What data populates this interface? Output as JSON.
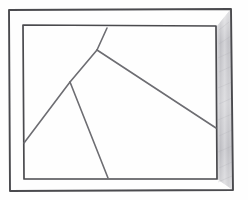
{
  "document": {
    "title": "Hand-drawn framed geometric partition sketch",
    "medium": "pencil-on-paper line drawing",
    "width": 248,
    "height": 200
  },
  "colors": {
    "paper": "#fefefe",
    "ink": "#4a4a4e",
    "ink_light": "#6d6d72",
    "shading": "#b9b9bd",
    "shading_light": "#d8d8db"
  },
  "strokes": {
    "outer_frame_width": 1.9,
    "inner_frame_width": 1.7,
    "partition_width": 1.6
  },
  "shapes": {
    "outer_frame": {
      "name": "outer-frame",
      "points": "9,10 231,9 233,190 10,191"
    },
    "inner_frame": {
      "name": "inner-frame",
      "points": "23,25 216,26 217,179 24,179"
    },
    "shaded_band": {
      "name": "right-border-shading",
      "points": "217,26 231,9 233,190 217,179"
    }
  },
  "partitions": [
    {
      "name": "partition-line-upper-left",
      "from_label": "top-edge",
      "to_label": "center-junction",
      "x1": 107,
      "y1": 28,
      "x2": 97,
      "y2": 50
    },
    {
      "name": "partition-line-long-diagonal",
      "from_label": "center-junction",
      "to_label": "right-edge",
      "x1": 97,
      "y1": 50,
      "x2": 216,
      "y2": 128
    },
    {
      "name": "partition-line-middle-left",
      "from_label": "center-junction",
      "to_label": "lower-junction",
      "x1": 97,
      "y1": 50,
      "x2": 70,
      "y2": 82
    },
    {
      "name": "partition-line-lower-left",
      "from_label": "lower-junction",
      "to_label": "left-edge",
      "x1": 70,
      "y1": 82,
      "x2": 24,
      "y2": 143
    },
    {
      "name": "partition-line-lower-right",
      "from_label": "lower-junction",
      "to_label": "bottom-edge",
      "x1": 70,
      "y1": 82,
      "x2": 108,
      "y2": 178
    }
  ],
  "vertices": [
    {
      "name": "vertex-top-edge",
      "x": 107,
      "y": 28
    },
    {
      "name": "vertex-center-junction",
      "x": 97,
      "y": 50
    },
    {
      "name": "vertex-lower-junction",
      "x": 70,
      "y": 82
    },
    {
      "name": "vertex-left-edge",
      "x": 24,
      "y": 143
    },
    {
      "name": "vertex-bottom-edge",
      "x": 108,
      "y": 178
    },
    {
      "name": "vertex-right-edge",
      "x": 216,
      "y": 128
    }
  ]
}
